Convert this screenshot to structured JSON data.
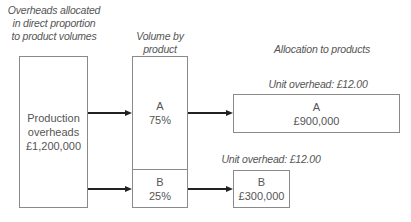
{
  "headings": {
    "overheads_allocated": [
      "Overheads allocated",
      "in direct proportion",
      "to product volumes"
    ],
    "volume_by_product": [
      "Volume by",
      "product"
    ],
    "allocation_to_products": "Allocation to products"
  },
  "source_box": {
    "lines": [
      "Production",
      "overheads",
      "£1,200,000"
    ]
  },
  "volume_split": [
    {
      "product": "A",
      "share": "75%"
    },
    {
      "product": "B",
      "share": "25%"
    }
  ],
  "allocations": [
    {
      "product": "A",
      "amount": "£900,000",
      "unit_label": "Unit overhead: £12.00"
    },
    {
      "product": "B",
      "amount": "£300,000",
      "unit_label": "Unit overhead: £12.00"
    }
  ]
}
